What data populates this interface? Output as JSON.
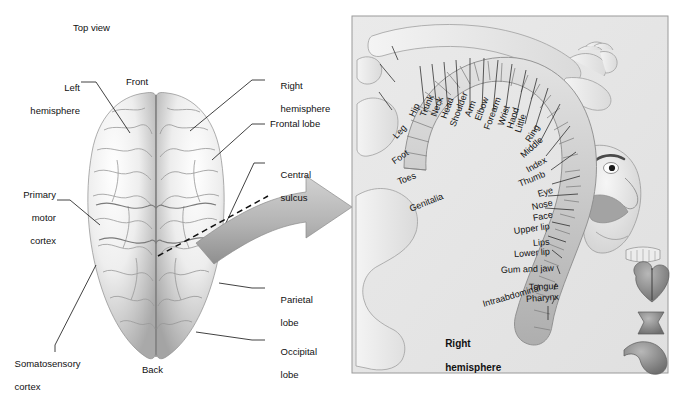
{
  "figure": {
    "title_left": "Top view",
    "panel_bg": "#e8e8e8",
    "panel_border": "#9a9a9a",
    "arrow_color": "#a8a8a8",
    "brain_light": "#f2f2f2",
    "brain_shadow": "#9c9c9c"
  },
  "left_diagram": {
    "name": "top-view-brain",
    "heading": "Top view",
    "orientation": {
      "front": "Front",
      "back": "Back"
    },
    "callouts_left": [
      {
        "id": "left-hemisphere",
        "line1": "Left",
        "line2": "hemisphere"
      },
      {
        "id": "primary-motor-cortex",
        "line1": "Primary",
        "line2": "motor",
        "line3": "cortex"
      },
      {
        "id": "somatosensory-cortex",
        "line1": "Somatosensory",
        "line2": "cortex"
      }
    ],
    "callouts_right": [
      {
        "id": "right-hemisphere",
        "line1": "Right",
        "line2": "hemisphere"
      },
      {
        "id": "frontal-lobe",
        "line1": "Frontal lobe"
      },
      {
        "id": "central-sulcus",
        "line1": "Central",
        "line2": "sulcus"
      },
      {
        "id": "parietal-lobe",
        "line1": "Parietal",
        "line2": "lobe"
      },
      {
        "id": "occipital-lobe",
        "line1": "Occipital",
        "line2": "lobe"
      }
    ]
  },
  "right_panel": {
    "name": "motor-homunculus",
    "hemisphere_label_line1": "Right",
    "hemisphere_label_line2": "hemisphere",
    "body_map_labels": [
      {
        "id": "genitalia",
        "text": "Genitalia",
        "x": 410,
        "y": 205,
        "rot": -22
      },
      {
        "id": "toes",
        "text": "Toes",
        "x": 398,
        "y": 178,
        "rot": -22
      },
      {
        "id": "foot",
        "text": "Foot",
        "x": 393,
        "y": 158,
        "rot": -35
      },
      {
        "id": "leg",
        "text": "Leg",
        "x": 395,
        "y": 133,
        "rot": -48
      },
      {
        "id": "hip",
        "text": "Hip",
        "x": 412,
        "y": 112,
        "rot": -66
      },
      {
        "id": "trunk",
        "text": "Trunk",
        "x": 423,
        "y": 112,
        "rot": -68
      },
      {
        "id": "neck",
        "text": "Neck",
        "x": 434,
        "y": 112,
        "rot": -70
      },
      {
        "id": "head",
        "text": "Head",
        "x": 444,
        "y": 114,
        "rot": -70
      },
      {
        "id": "shoulder",
        "text": "Shoulder",
        "x": 453,
        "y": 122,
        "rot": -70
      },
      {
        "id": "arm",
        "text": "Arm",
        "x": 468,
        "y": 112,
        "rot": -70
      },
      {
        "id": "elbow",
        "text": "Elbow",
        "x": 478,
        "y": 116,
        "rot": -70
      },
      {
        "id": "forearm",
        "text": "Forearm",
        "x": 487,
        "y": 125,
        "rot": -70
      },
      {
        "id": "wrist",
        "text": "Wrist",
        "x": 501,
        "y": 121,
        "rot": -72
      },
      {
        "id": "hand",
        "text": "Hand",
        "x": 510,
        "y": 124,
        "rot": -72
      },
      {
        "id": "little",
        "text": "Little",
        "x": 518,
        "y": 128,
        "rot": -72
      },
      {
        "id": "ring",
        "text": "Ring",
        "x": 528,
        "y": 137,
        "rot": -58
      },
      {
        "id": "middle",
        "text": "Middle",
        "x": 522,
        "y": 152,
        "rot": -42
      },
      {
        "id": "index",
        "text": "Index",
        "x": 527,
        "y": 166,
        "rot": -30
      },
      {
        "id": "thumb",
        "text": "Thumb",
        "x": 519,
        "y": 180,
        "rot": -22
      },
      {
        "id": "eye",
        "text": "Eye",
        "x": 538,
        "y": 190,
        "rot": -16
      },
      {
        "id": "nose",
        "text": "Nose",
        "x": 532,
        "y": 203,
        "rot": -12
      },
      {
        "id": "face",
        "text": "Face",
        "x": 533,
        "y": 214,
        "rot": -10
      },
      {
        "id": "upper-lip",
        "text": "Upper lip",
        "x": 514,
        "y": 227,
        "rot": -8
      },
      {
        "id": "lips",
        "text": "Lips",
        "x": 533,
        "y": 239,
        "rot": -5
      },
      {
        "id": "lower-lip",
        "text": "Lower lip",
        "x": 514,
        "y": 250,
        "rot": -4
      },
      {
        "id": "gum-and-jaw",
        "text": "Gum and jaw",
        "x": 501,
        "y": 266,
        "rot": -2
      },
      {
        "id": "tongue",
        "text": "Tongue",
        "x": 529,
        "y": 283,
        "rot": -2
      },
      {
        "id": "pharynx",
        "text": "Pharynx",
        "x": 526,
        "y": 295,
        "rot": -4
      },
      {
        "id": "intraabdominal",
        "text": "Intraabdominal",
        "x": 483,
        "y": 300,
        "rot": -16
      }
    ]
  }
}
